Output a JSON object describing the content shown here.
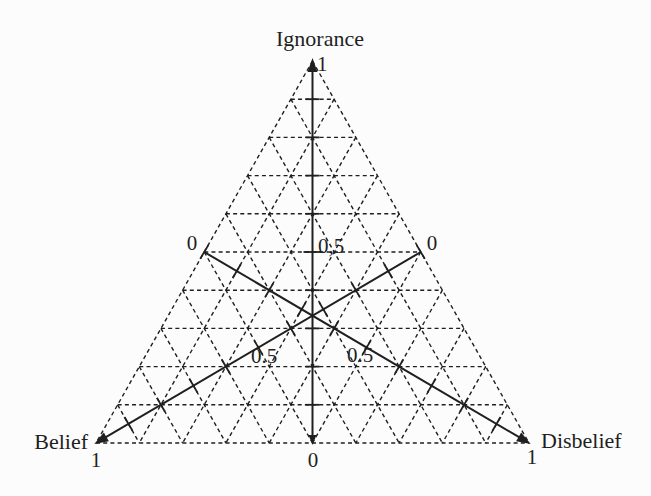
{
  "figure": {
    "background": "#fcfcfc",
    "line_color": "#1f1f1f"
  },
  "chart_data": {
    "type": "ternary",
    "grid": {
      "divisions": 10,
      "style": "dashed",
      "range": [
        0,
        1
      ],
      "tick_interval": 0.1
    },
    "vertices": {
      "top": {
        "axis": "ignorance",
        "value": 1
      },
      "bottom_left": {
        "axis": "belief",
        "value": 1
      },
      "bottom_right": {
        "axis": "disbelief",
        "value": 1
      }
    },
    "axes": [
      {
        "id": "ignorance",
        "label": "Ignorance",
        "min": 0,
        "mid": 0.5,
        "max": 1,
        "min_label": "0",
        "mid_label": "0,5",
        "max_label": "1",
        "path": "bottom-edge midpoint to top vertex"
      },
      {
        "id": "belief",
        "label": "Belief",
        "min": 0,
        "mid": 0.5,
        "max": 1,
        "min_label": "0",
        "mid_label": "0.5",
        "max_label": "1",
        "path": "right-edge midpoint to bottom-left vertex"
      },
      {
        "id": "disbelief",
        "label": "Disbelief",
        "min": 0,
        "mid": 0.5,
        "max": 1,
        "min_label": "0",
        "mid_label": "0.5",
        "max_label": "1",
        "path": "left-edge midpoint to bottom-right vertex"
      }
    ]
  }
}
